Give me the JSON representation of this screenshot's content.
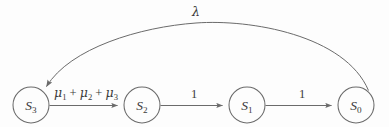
{
  "diagram": {
    "type": "state-transition-diagram",
    "title": "",
    "background_color": "#fdfdfd",
    "stroke_color": "#6b6b6b",
    "text_color": "#3a3a3a",
    "nodes": [
      {
        "id": "S3",
        "label_base": "S",
        "label_sub": "3",
        "cx": 31,
        "cy": 105,
        "r": 18
      },
      {
        "id": "S2",
        "label_base": "S",
        "label_sub": "2",
        "cx": 142,
        "cy": 105,
        "r": 18
      },
      {
        "id": "S1",
        "label_base": "S",
        "label_sub": "1",
        "cx": 247,
        "cy": 105,
        "r": 18
      },
      {
        "id": "S0",
        "label_base": "S",
        "label_sub": "0",
        "cx": 356,
        "cy": 105,
        "r": 18
      }
    ],
    "edges": [
      {
        "id": "e-s3-s2",
        "from": "S3",
        "to": "S2",
        "shape": "straight",
        "label_text": "μ1 + μ2 + μ3",
        "label_parts": [
          {
            "glyph": "μ",
            "sub": "1"
          },
          {
            "op": " + "
          },
          {
            "glyph": "μ",
            "sub": "2"
          },
          {
            "op": " + "
          },
          {
            "glyph": "μ",
            "sub": "3"
          }
        ],
        "label_x": 86,
        "label_y": 97
      },
      {
        "id": "e-s2-s1",
        "from": "S2",
        "to": "S1",
        "shape": "straight",
        "label_text": "1",
        "label_x": 194,
        "label_y": 98
      },
      {
        "id": "e-s1-s0",
        "from": "S1",
        "to": "S0",
        "shape": "straight",
        "label_text": "1",
        "label_x": 302,
        "label_y": 98
      },
      {
        "id": "e-s0-s3",
        "from": "S0",
        "to": "S3",
        "shape": "arc",
        "label_text": "λ",
        "label_x": 196,
        "label_y": 16
      }
    ]
  }
}
